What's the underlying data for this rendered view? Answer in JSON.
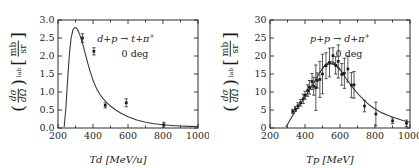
{
  "figure": {
    "panels": [
      {
        "id": "left-panel",
        "annotation_reaction": "d+p → t+π",
        "annotation_reaction_sup": "+",
        "annotation_angle": "0 deg",
        "ylabel_prefix": "(",
        "ylabel_num": "dσ",
        "ylabel_den": "dΩ",
        "ylabel_suffix": ")",
        "ylabel_exp": "lab",
        "ylabel_unit_num": "mb",
        "ylabel_unit_den": "sr",
        "xlabel": "Td [MeV/u]",
        "xticks": [
          "200",
          "400",
          "600",
          "800",
          "1000"
        ],
        "yticks": [
          "0.0",
          "0.5",
          "1.0",
          "1.5",
          "2.0",
          "2.5",
          "3.0"
        ]
      },
      {
        "id": "right-panel",
        "annotation_reaction": "p+p → d+π",
        "annotation_reaction_sup": "+",
        "annotation_angle": "0 deg",
        "ylabel_prefix": "(",
        "ylabel_num": "dσ",
        "ylabel_den": "dΩ",
        "ylabel_suffix": ")",
        "ylabel_exp": "lab",
        "ylabel_unit_num": "mb",
        "ylabel_unit_den": "sr",
        "xlabel": "Tp [MeV]",
        "xticks": [
          "200",
          "400",
          "600",
          "800",
          "1000"
        ],
        "yticks": [
          "0",
          "5",
          "10",
          "15",
          "20",
          "25",
          "30"
        ]
      }
    ]
  },
  "chart_data": [
    {
      "type": "line",
      "id": "left-panel",
      "title": "",
      "xlabel": "Td [MeV/u]",
      "ylabel": "(dsigma/dOmega)^lab [mb/sr]",
      "annotations": [
        "d+p -> t+pi+",
        "0 deg"
      ],
      "xlim": [
        200,
        1000
      ],
      "ylim": [
        0.0,
        3.0
      ],
      "xticks": [
        200,
        400,
        600,
        800,
        1000
      ],
      "yticks": [
        0.0,
        0.5,
        1.0,
        1.5,
        2.0,
        2.5,
        3.0
      ],
      "grid": false,
      "legend": "none",
      "series": [
        {
          "name": "theory curve",
          "kind": "line",
          "x": [
            235,
            245,
            255,
            265,
            275,
            285,
            295,
            305,
            315,
            325,
            340,
            355,
            370,
            385,
            400,
            420,
            440,
            460,
            480,
            500,
            530,
            560,
            600,
            650,
            700,
            750,
            800,
            850,
            900,
            950,
            1000
          ],
          "y": [
            0.02,
            0.55,
            1.35,
            2.05,
            2.5,
            2.72,
            2.79,
            2.78,
            2.7,
            2.58,
            2.35,
            2.08,
            1.8,
            1.55,
            1.33,
            1.1,
            0.93,
            0.8,
            0.7,
            0.61,
            0.5,
            0.41,
            0.31,
            0.22,
            0.16,
            0.12,
            0.09,
            0.07,
            0.055,
            0.045,
            0.04
          ]
        },
        {
          "name": "experimental data",
          "kind": "errorbar",
          "x": [
            340,
            405,
            470,
            590,
            805
          ],
          "y": [
            2.5,
            2.13,
            0.63,
            0.7,
            0.09
          ],
          "yerr": [
            0.12,
            0.1,
            0.07,
            0.11,
            0.07
          ]
        }
      ]
    },
    {
      "type": "line",
      "id": "right-panel",
      "title": "",
      "xlabel": "Tp [MeV]",
      "ylabel": "(dsigma/dOmega)^lab [mb/sr]",
      "annotations": [
        "p+p -> d+pi+",
        "0 deg"
      ],
      "xlim": [
        200,
        1000
      ],
      "ylim": [
        0,
        30
      ],
      "xticks": [
        200,
        400,
        600,
        800,
        1000
      ],
      "yticks": [
        0,
        5,
        10,
        15,
        20,
        25,
        30
      ],
      "grid": false,
      "legend": "none",
      "series": [
        {
          "name": "theory curve",
          "kind": "line",
          "x": [
            290,
            300,
            310,
            325,
            340,
            355,
            370,
            385,
            400,
            415,
            430,
            445,
            460,
            475,
            490,
            505,
            520,
            535,
            550,
            565,
            580,
            595,
            610,
            630,
            650,
            670,
            690,
            710,
            740,
            770,
            800,
            840,
            880,
            920,
            960,
            1000
          ],
          "y": [
            0.3,
            1.0,
            1.9,
            3.1,
            4.3,
            5.3,
            6.4,
            7.5,
            8.6,
            9.8,
            11.0,
            12.2,
            13.4,
            14.6,
            15.8,
            16.9,
            17.7,
            18.2,
            18.4,
            18.2,
            17.6,
            16.7,
            15.6,
            14.1,
            12.7,
            11.4,
            10.2,
            9.1,
            7.6,
            6.3,
            5.3,
            4.2,
            3.4,
            2.7,
            2.1,
            1.6
          ]
        },
        {
          "name": "theory curve 2",
          "kind": "line",
          "x": [
            495,
            510,
            525,
            540,
            555,
            570,
            585,
            600
          ],
          "y": [
            16.2,
            17.1,
            17.6,
            17.8,
            17.8,
            17.5,
            16.9,
            16.1
          ]
        },
        {
          "name": "experimental data",
          "kind": "errorbar",
          "x": [
            330,
            345,
            360,
            375,
            390,
            400,
            415,
            425,
            440,
            450,
            462,
            470,
            485,
            500,
            520,
            540,
            560,
            575,
            590,
            610,
            625,
            645,
            665,
            680,
            740,
            805,
            900,
            980
          ],
          "y": [
            4.6,
            5.3,
            6.2,
            7.0,
            8.1,
            9.1,
            10.4,
            11.3,
            12.9,
            11.6,
            11.2,
            13.2,
            13.5,
            15.0,
            17.3,
            18.2,
            20.1,
            17.4,
            18.5,
            14.9,
            15.2,
            16.4,
            11.9,
            12.0,
            6.1,
            3.9,
            2.0,
            1.3
          ],
          "yerr": [
            0.6,
            0.7,
            0.8,
            0.9,
            1.3,
            1.1,
            1.6,
            1.9,
            2.2,
            2.5,
            6.3,
            2.1,
            5.0,
            5.5,
            3.6,
            4.0,
            2.2,
            2.4,
            4.6,
            3.0,
            4.2,
            3.6,
            3.5,
            3.7,
            1.6,
            3.3,
            0.8,
            0.9
          ]
        }
      ]
    }
  ]
}
